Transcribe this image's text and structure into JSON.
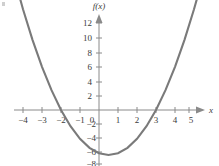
{
  "chart_data": {
    "type": "line",
    "title": "",
    "subtitle": "",
    "xlabel": "x",
    "ylabel": "f(x)",
    "function": "f(x) = x^2 - x - 6",
    "grid": false,
    "legend": "none",
    "xlim": [
      -4.8,
      5.6
    ],
    "ylim": [
      -8.5,
      13.5
    ],
    "x_ticks": [
      -4,
      -3,
      -2,
      -1,
      0,
      1,
      2,
      3,
      4,
      5
    ],
    "x_tick_labels": [
      "−4",
      "−3",
      "−2",
      "−1",
      "0",
      "1",
      "2",
      "3",
      "4",
      "5"
    ],
    "y_ticks": [
      -8,
      -6,
      -4,
      -2,
      2,
      4,
      6,
      8,
      10,
      12
    ],
    "y_tick_labels": [
      "−8",
      "−6",
      "−4",
      "−2",
      "2",
      "4",
      "6",
      "8",
      "10",
      "12"
    ],
    "origin_label": "0",
    "roots": [
      -2,
      3
    ],
    "vertex": [
      0.5,
      -6.25
    ],
    "y_intercept": -6,
    "series": [
      {
        "name": "f(x) = x^2 - x - 6",
        "color": "#7a7a7a",
        "x": [
          -4.4,
          -4.0,
          -3.5,
          -3.0,
          -2.5,
          -2.0,
          -1.5,
          -1.0,
          -0.5,
          0.0,
          0.5,
          1.0,
          1.5,
          2.0,
          2.5,
          3.0,
          3.5,
          4.0,
          4.5,
          5.0,
          5.4
        ],
        "values": [
          17.8,
          14.0,
          9.75,
          6.0,
          2.75,
          0.0,
          -2.25,
          -4.0,
          -5.25,
          -6.0,
          -6.25,
          -6.0,
          -5.25,
          -4.0,
          -2.25,
          0.0,
          2.75,
          6.0,
          9.75,
          14.0,
          17.7
        ]
      }
    ],
    "arrows": {
      "x_axis_arrow": "right",
      "y_axis_arrow": "up",
      "curve_left_arrow": "up-left",
      "curve_right_arrow": "up-right"
    }
  },
  "labels": {
    "x_axis_title": "x",
    "y_axis_title": "f(x)",
    "origin": "0",
    "x_ticks": [
      "−4",
      "−3",
      "−2",
      "−1",
      "1",
      "2",
      "3",
      "4",
      "5"
    ],
    "y_ticks": [
      "12",
      "10",
      "8",
      "6",
      "4",
      "2",
      "−2",
      "−4",
      "−6",
      "−8"
    ]
  },
  "colors": {
    "curve": "#7a7a7a",
    "axis": "#8a8a8a",
    "text": "#3b3b3b",
    "background": "#ffffff"
  }
}
